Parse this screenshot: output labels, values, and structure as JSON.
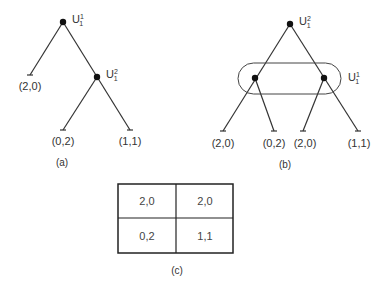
{
  "diagram_a": {
    "caption": "(a)",
    "root": {
      "label": "U",
      "sup": "1",
      "sub": "1"
    },
    "inner": {
      "label": "U",
      "sup": "2",
      "sub": "1"
    },
    "leaves": [
      "(2,0)",
      "(0,2)",
      "(1,1)"
    ]
  },
  "diagram_b": {
    "caption": "(b)",
    "root": {
      "label": "U",
      "sup": "2",
      "sub": "1"
    },
    "info_set": {
      "label": "U",
      "sup": "1",
      "sub": "1"
    },
    "leaves": [
      "(2,0)",
      "(0,2)",
      "(2,0)",
      "(1,1)"
    ]
  },
  "diagram_c": {
    "caption": "(c)",
    "matrix": [
      [
        "2,0",
        "2,0"
      ],
      [
        "0,2",
        "1,1"
      ]
    ]
  }
}
